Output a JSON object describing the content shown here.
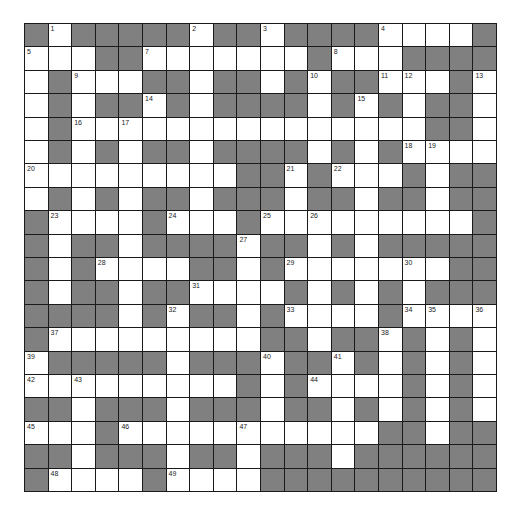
{
  "puzzle": {
    "rows": 20,
    "cols": 20,
    "colors": {
      "block": "#808080",
      "cell": "#ffffff",
      "grid_line": "#1a1a1a",
      "number": "#222222"
    },
    "legend": "B = black block, W = empty white cell, number = numbered white cell",
    "grid": [
      [
        "B",
        "1",
        "B",
        "B",
        "B",
        "B",
        "B",
        "2",
        "B",
        "B",
        "3",
        "B",
        "B",
        "B",
        "B",
        "4",
        "W",
        "W",
        "W",
        "B"
      ],
      [
        "5",
        "W",
        "W",
        "B",
        "B",
        "7",
        "W",
        "W",
        "W",
        "W",
        "W",
        "W",
        "B",
        "8",
        "W",
        "W",
        "B",
        "B",
        "B",
        "B"
      ],
      [
        "W",
        "B",
        "9",
        "W",
        "W",
        "B",
        "B",
        "W",
        "B",
        "B",
        "W",
        "B",
        "10",
        "B",
        "B",
        "11",
        "12",
        "W",
        "B",
        "13"
      ],
      [
        "W",
        "B",
        "W",
        "B",
        "B",
        "14",
        "B",
        "W",
        "B",
        "B",
        "B",
        "B",
        "W",
        "B",
        "15",
        "B",
        "W",
        "B",
        "B",
        "W"
      ],
      [
        "W",
        "B",
        "16",
        "W",
        "17",
        "W",
        "W",
        "W",
        "W",
        "W",
        "W",
        "W",
        "W",
        "W",
        "W",
        "W",
        "W",
        "B",
        "B",
        "W"
      ],
      [
        "W",
        "B",
        "W",
        "B",
        "W",
        "B",
        "B",
        "W",
        "B",
        "B",
        "B",
        "B",
        "W",
        "B",
        "W",
        "B",
        "18",
        "19",
        "W",
        "W"
      ],
      [
        "20",
        "W",
        "W",
        "W",
        "W",
        "W",
        "W",
        "W",
        "W",
        "B",
        "B",
        "21",
        "B",
        "22",
        "W",
        "W",
        "B",
        "W",
        "B",
        "B"
      ],
      [
        "W",
        "B",
        "W",
        "B",
        "W",
        "B",
        "B",
        "W",
        "B",
        "B",
        "B",
        "W",
        "B",
        "B",
        "W",
        "B",
        "B",
        "W",
        "B",
        "B"
      ],
      [
        "B",
        "23",
        "W",
        "W",
        "W",
        "B",
        "24",
        "W",
        "W",
        "B",
        "25",
        "W",
        "26",
        "W",
        "W",
        "W",
        "W",
        "W",
        "W",
        "B"
      ],
      [
        "B",
        "W",
        "B",
        "B",
        "W",
        "B",
        "B",
        "B",
        "B",
        "27",
        "B",
        "B",
        "W",
        "B",
        "W",
        "B",
        "B",
        "B",
        "B",
        "B"
      ],
      [
        "B",
        "W",
        "B",
        "28",
        "W",
        "W",
        "W",
        "B",
        "B",
        "W",
        "B",
        "29",
        "W",
        "W",
        "W",
        "W",
        "30",
        "W",
        "B",
        "B"
      ],
      [
        "B",
        "W",
        "B",
        "B",
        "W",
        "B",
        "B",
        "31",
        "W",
        "W",
        "W",
        "B",
        "W",
        "B",
        "W",
        "B",
        "W",
        "B",
        "B",
        "B"
      ],
      [
        "B",
        "B",
        "B",
        "B",
        "W",
        "B",
        "32",
        "B",
        "B",
        "W",
        "B",
        "33",
        "W",
        "W",
        "W",
        "B",
        "34",
        "35",
        "W",
        "36"
      ],
      [
        "B",
        "37",
        "W",
        "W",
        "W",
        "W",
        "W",
        "W",
        "W",
        "W",
        "B",
        "B",
        "W",
        "B",
        "B",
        "38",
        "B",
        "W",
        "B",
        "W"
      ],
      [
        "39",
        "B",
        "B",
        "B",
        "B",
        "B",
        "W",
        "B",
        "B",
        "B",
        "40",
        "B",
        "B",
        "41",
        "B",
        "W",
        "B",
        "W",
        "B",
        "W"
      ],
      [
        "42",
        "W",
        "43",
        "W",
        "W",
        "W",
        "W",
        "W",
        "W",
        "B",
        "W",
        "B",
        "44",
        "W",
        "W",
        "W",
        "B",
        "W",
        "B",
        "W"
      ],
      [
        "B",
        "B",
        "W",
        "B",
        "B",
        "B",
        "W",
        "B",
        "B",
        "B",
        "W",
        "B",
        "B",
        "W",
        "B",
        "W",
        "B",
        "W",
        "B",
        "W"
      ],
      [
        "45",
        "W",
        "W",
        "B",
        "46",
        "W",
        "W",
        "W",
        "W",
        "47",
        "W",
        "W",
        "W",
        "W",
        "W",
        "B",
        "B",
        "W",
        "B",
        "B"
      ],
      [
        "B",
        "B",
        "W",
        "B",
        "B",
        "B",
        "W",
        "B",
        "B",
        "W",
        "B",
        "B",
        "B",
        "W",
        "B",
        "B",
        "B",
        "B",
        "B",
        "B"
      ],
      [
        "B",
        "48",
        "W",
        "W",
        "W",
        "B",
        "49",
        "W",
        "W",
        "W",
        "B",
        "B",
        "B",
        "B",
        "B",
        "B",
        "B",
        "B",
        "B",
        "B"
      ]
    ],
    "clue_numbers": [
      1,
      2,
      3,
      4,
      5,
      7,
      8,
      9,
      10,
      11,
      12,
      13,
      14,
      15,
      16,
      17,
      18,
      19,
      20,
      21,
      22,
      23,
      24,
      25,
      26,
      27,
      28,
      29,
      30,
      31,
      32,
      33,
      34,
      35,
      36,
      37,
      38,
      39,
      40,
      41,
      42,
      43,
      44,
      45,
      46,
      47,
      48,
      49
    ]
  }
}
